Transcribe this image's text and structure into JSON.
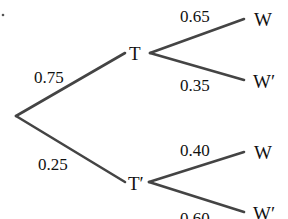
{
  "colors": {
    "edge": "#444444",
    "text": "#111111",
    "background": "#ffffff"
  },
  "tree": {
    "root": {
      "x": 16,
      "y": 116
    },
    "first_level": [
      {
        "label": "T",
        "probability": "0.75",
        "edge": {
          "x1": 16,
          "y1": 116,
          "x2": 125,
          "y2": 53
        },
        "label_pos": {
          "x": 129,
          "y": 60
        },
        "prob_pos": {
          "x": 34,
          "y": 83
        },
        "children": [
          {
            "label": "W",
            "probability": "0.65",
            "edge": {
              "x1": 150,
              "y1": 53,
              "x2": 244,
              "y2": 19
            },
            "label_pos": {
              "x": 254,
              "y": 26
            },
            "prob_pos": {
              "x": 180,
              "y": 22
            }
          },
          {
            "label": "W′",
            "probability": "0.35",
            "edge": {
              "x1": 150,
              "y1": 53,
              "x2": 244,
              "y2": 80
            },
            "label_pos": {
              "x": 253,
              "y": 88
            },
            "prob_pos": {
              "x": 180,
              "y": 91
            }
          }
        ]
      },
      {
        "label": "T′",
        "probability": "0.25",
        "edge": {
          "x1": 16,
          "y1": 116,
          "x2": 125,
          "y2": 182
        },
        "label_pos": {
          "x": 128,
          "y": 190
        },
        "prob_pos": {
          "x": 38,
          "y": 170
        },
        "children": [
          {
            "label": "W",
            "probability": "0.40",
            "edge": {
              "x1": 149,
              "y1": 182,
              "x2": 244,
              "y2": 152
            },
            "label_pos": {
              "x": 254,
              "y": 159
            },
            "prob_pos": {
              "x": 180,
              "y": 156
            }
          },
          {
            "label": "W′",
            "probability": "0.60",
            "edge": {
              "x1": 149,
              "y1": 182,
              "x2": 244,
              "y2": 212
            },
            "label_pos": {
              "x": 253,
              "y": 220
            },
            "prob_pos": {
              "x": 180,
              "y": 224
            }
          }
        ]
      }
    ]
  }
}
